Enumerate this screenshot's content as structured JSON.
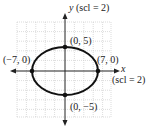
{
  "diagram": {
    "type": "ellipse-graph",
    "equation_semi_axes": {
      "a": 7,
      "b": 5
    },
    "center": [
      0,
      0
    ],
    "y_axis_label": {
      "var": "y",
      "scale": "(scl = 2)"
    },
    "x_axis_label": {
      "var": "x",
      "scale": "(scl = 2)"
    },
    "points": [
      {
        "label": "(0, 5)",
        "x": 0,
        "y": 5
      },
      {
        "label": "(7, 0)",
        "x": 7,
        "y": 0
      },
      {
        "label": "(−7, 0)",
        "x": -7,
        "y": 0
      },
      {
        "label": "(0, −5)",
        "x": 0,
        "y": -5
      }
    ],
    "colors": {
      "curve": "#111111",
      "grid": "#bdbdbd",
      "axis": "#222222"
    }
  }
}
